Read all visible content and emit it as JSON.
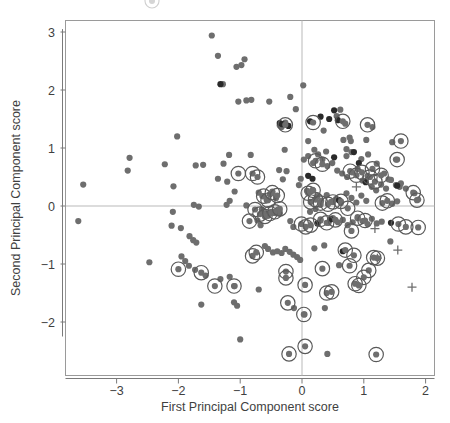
{
  "chart_data": {
    "type": "scatter",
    "title": "",
    "xlabel": "First Principal Component score",
    "ylabel": "Second Principal Component score",
    "xlim": [
      -3.75,
      2.15
    ],
    "ylim": [
      -2.75,
      3.3
    ],
    "xticks": [
      -3,
      -2,
      -1,
      0,
      1,
      2
    ],
    "xticklabels": [
      "−3",
      "−2",
      "−1",
      "0",
      "1",
      "2"
    ],
    "yticks": [
      -2,
      -1,
      0,
      1,
      2,
      3
    ],
    "yticklabels": [
      "−2",
      "−1",
      "0",
      "1",
      "2",
      "3"
    ],
    "grid": false,
    "reference_lines": {
      "vertical_x": 0,
      "horizontal_y": 0,
      "color": "#b9b9b9"
    },
    "legend": {
      "position": "top",
      "visible_fragment": "partially cropped circled-point marker above plot frame"
    },
    "marker_styles": {
      "plain": {
        "name": "plain-point",
        "fill": "#6e6e6e",
        "radius": 3.1
      },
      "dark": {
        "name": "dark-point",
        "fill": "#2a2a2a",
        "radius": 3.1
      },
      "circled": {
        "name": "circled-point",
        "fill": "#6e6e6e",
        "radius": 3.1,
        "ring_radius": 7.2,
        "ring_color": "#5a5a5a"
      },
      "cross": {
        "name": "cross-point",
        "color": "#6e6e6e",
        "size": 4.5
      }
    },
    "series": [
      {
        "name": "plain",
        "style": "plain",
        "points": [
          [
            -1.46,
            2.94
          ],
          [
            -1.36,
            2.59
          ],
          [
            -1.06,
            2.4
          ],
          [
            -0.98,
            2.43
          ],
          [
            -0.93,
            2.53
          ],
          [
            -1.28,
            2.1
          ],
          [
            0.02,
            2.08
          ],
          [
            -1.03,
            1.8
          ],
          [
            -0.9,
            1.82
          ],
          [
            -0.82,
            1.83
          ],
          [
            -0.53,
            1.8
          ],
          [
            -0.19,
            1.88
          ],
          [
            -0.1,
            1.67
          ],
          [
            0.62,
            1.66
          ],
          [
            0.56,
            1.55
          ],
          [
            -2.02,
            1.2
          ],
          [
            -0.27,
            1.44
          ],
          [
            -0.36,
            1.39
          ],
          [
            -0.33,
            1.36
          ],
          [
            0.7,
            1.42
          ],
          [
            0.35,
            1.3
          ],
          [
            0.79,
            1.12
          ],
          [
            0.77,
            1.18
          ],
          [
            1.14,
            1.36
          ],
          [
            0.1,
            1.12
          ],
          [
            -2.79,
            0.83
          ],
          [
            -2.82,
            0.61
          ],
          [
            -3.54,
            0.37
          ],
          [
            -2.22,
            0.72
          ],
          [
            -1.18,
            0.88
          ],
          [
            -0.83,
            0.88
          ],
          [
            -0.28,
            0.97
          ],
          [
            -1.72,
            0.7
          ],
          [
            -1.6,
            0.71
          ],
          [
            -1.27,
            0.73
          ],
          [
            -0.37,
            0.62
          ],
          [
            -0.25,
            0.6
          ],
          [
            -0.31,
            0.46
          ],
          [
            -1.36,
            0.47
          ],
          [
            -2.08,
            0.34
          ],
          [
            -1.21,
            0.42
          ],
          [
            -1.09,
            0.25
          ],
          [
            -1.17,
            0.09
          ],
          [
            -1.22,
            0.02
          ],
          [
            -1.75,
            0.02
          ],
          [
            -1.67,
            -0.01
          ],
          [
            -0.9,
            0.01
          ],
          [
            -0.7,
            0.23
          ],
          [
            -0.64,
            0.17
          ],
          [
            -0.52,
            0.2
          ],
          [
            -0.48,
            0.25
          ],
          [
            -0.42,
            0.14
          ],
          [
            -0.57,
            0.1
          ],
          [
            -0.65,
            -0.06
          ],
          [
            -0.6,
            -0.13
          ],
          [
            -0.55,
            -0.17
          ],
          [
            -0.5,
            -0.1
          ],
          [
            -0.45,
            -0.12
          ],
          [
            -0.39,
            -0.06
          ],
          [
            -0.36,
            -0.13
          ],
          [
            -0.72,
            -0.25
          ],
          [
            -0.67,
            -0.33
          ],
          [
            0.08,
            0.26
          ],
          [
            0.17,
            0.28
          ],
          [
            0.25,
            0.17
          ],
          [
            0.31,
            0.09
          ],
          [
            0.4,
            0.19
          ],
          [
            0.47,
            0.07
          ],
          [
            0.55,
            0.12
          ],
          [
            0.63,
            0.05
          ],
          [
            0.72,
            0.22
          ],
          [
            0.8,
            0.14
          ],
          [
            0.88,
            0.06
          ],
          [
            0.96,
            0.18
          ],
          [
            1.04,
            0.09
          ],
          [
            1.13,
            0.33
          ],
          [
            1.2,
            0.27
          ],
          [
            1.28,
            0.37
          ],
          [
            1.36,
            0.3
          ],
          [
            1.44,
            0.45
          ],
          [
            1.52,
            0.36
          ],
          [
            1.6,
            0.39
          ],
          [
            1.68,
            0.3
          ],
          [
            0.03,
            0.8
          ],
          [
            0.1,
            0.86
          ],
          [
            0.18,
            0.74
          ],
          [
            0.26,
            0.89
          ],
          [
            0.33,
            0.8
          ],
          [
            0.41,
            0.69
          ],
          [
            0.49,
            0.74
          ],
          [
            0.57,
            0.61
          ],
          [
            0.65,
            0.56
          ],
          [
            0.73,
            0.5
          ],
          [
            0.81,
            0.58
          ],
          [
            0.9,
            0.64
          ],
          [
            0.98,
            0.44
          ],
          [
            1.06,
            0.52
          ],
          [
            0.72,
            0.86
          ],
          [
            0.8,
            0.93
          ],
          [
            0.96,
            0.81
          ],
          [
            1.07,
            0.89
          ],
          [
            1.21,
            0.73
          ],
          [
            1.46,
            1.1
          ],
          [
            1.52,
            0.8
          ],
          [
            1.33,
            0.56
          ],
          [
            1.4,
            0.46
          ],
          [
            -3.62,
            -0.26
          ],
          [
            -2.47,
            -0.97
          ],
          [
            -2.09,
            -0.1
          ],
          [
            -2.11,
            -0.34
          ],
          [
            -1.96,
            -0.38
          ],
          [
            -1.82,
            -0.52
          ],
          [
            -1.76,
            -0.59
          ],
          [
            -1.71,
            -0.63
          ],
          [
            -1.95,
            -0.87
          ],
          [
            -1.89,
            -0.95
          ],
          [
            -1.83,
            -1.03
          ],
          [
            -1.73,
            -1.1
          ],
          [
            -1.56,
            -1.2
          ],
          [
            -1.63,
            -1.7
          ],
          [
            -1.32,
            -1.26
          ],
          [
            -1.17,
            -1.22
          ],
          [
            -1.09,
            -1.38
          ],
          [
            -1.1,
            -1.66
          ],
          [
            -1.05,
            -1.72
          ],
          [
            -1.0,
            -2.3
          ],
          [
            -0.7,
            -1.44
          ],
          [
            -0.6,
            -0.69
          ],
          [
            -0.55,
            -0.74
          ],
          [
            -0.47,
            -0.8
          ],
          [
            -0.4,
            -0.78
          ],
          [
            -0.33,
            -0.81
          ],
          [
            -0.27,
            -0.74
          ],
          [
            -0.2,
            -0.79
          ],
          [
            -0.14,
            -0.84
          ],
          [
            -0.08,
            -0.88
          ],
          [
            -0.03,
            -0.93
          ],
          [
            0.04,
            -1.87
          ],
          [
            -0.13,
            -1.76
          ],
          [
            0.37,
            -1.76
          ],
          [
            0.41,
            -2.55
          ],
          [
            -0.14,
            -0.36
          ],
          [
            -0.19,
            -0.26
          ],
          [
            0.2,
            -0.73
          ],
          [
            0.36,
            -0.68
          ],
          [
            0.3,
            -0.25
          ],
          [
            0.43,
            -0.29
          ],
          [
            0.5,
            -0.21
          ],
          [
            0.58,
            -0.28
          ],
          [
            0.66,
            -0.24
          ],
          [
            0.74,
            -0.33
          ],
          [
            0.82,
            -0.28
          ],
          [
            0.9,
            -0.19
          ],
          [
            0.98,
            -0.26
          ],
          [
            1.06,
            -0.31
          ],
          [
            0.6,
            -1.02
          ],
          [
            1.13,
            -0.22
          ],
          [
            1.21,
            -0.3
          ],
          [
            1.29,
            -0.27
          ],
          [
            1.43,
            -0.61
          ],
          [
            0.13,
            -0.1
          ],
          [
            0.22,
            -0.05
          ],
          [
            0.3,
            0.02
          ],
          [
            1.46,
            0.04
          ],
          [
            1.54,
            0.08
          ],
          [
            1.82,
            0.22
          ],
          [
            1.88,
            0.11
          ],
          [
            1.58,
            0.33
          ],
          [
            0.67,
            1.14
          ],
          [
            1.04,
            1.14
          ],
          [
            0.72,
            0.98
          ],
          [
            0.39,
            0.94
          ],
          [
            0.2,
            0.97
          ],
          [
            -0.02,
            0.47
          ],
          [
            -0.05,
            0.36
          ]
        ]
      },
      {
        "name": "dark",
        "style": "dark",
        "points": [
          [
            -1.32,
            2.1
          ],
          [
            0.52,
            1.65
          ],
          [
            0.3,
            1.54
          ],
          [
            0.44,
            1.5
          ],
          [
            -0.32,
            1.41
          ],
          [
            -0.36,
            1.43
          ],
          [
            -0.22,
            1.38
          ],
          [
            0.13,
            1.46
          ],
          [
            0.58,
            1.48
          ],
          [
            0.84,
            0.93
          ],
          [
            0.1,
            0.52
          ],
          [
            0.17,
            0.47
          ],
          [
            0.52,
            0.84
          ],
          [
            0.47,
            -0.23
          ],
          [
            0.6,
            0.1
          ],
          [
            1.03,
            0.41
          ],
          [
            1.54,
            0.35
          ],
          [
            1.44,
            -0.29
          ],
          [
            0.66,
            -0.78
          ],
          [
            0.25,
            -0.3
          ],
          [
            0.92,
            0.74
          ]
        ]
      },
      {
        "name": "circled",
        "style": "circled",
        "points": [
          [
            -0.27,
            1.4
          ],
          [
            0.18,
            1.44
          ],
          [
            0.66,
            1.46
          ],
          [
            1.06,
            1.4
          ],
          [
            1.6,
            1.12
          ],
          [
            1.54,
            0.8
          ],
          [
            1.14,
            0.64
          ],
          [
            -0.8,
            0.56
          ],
          [
            -0.72,
            0.5
          ],
          [
            -1.03,
            0.56
          ],
          [
            -0.62,
            0.17
          ],
          [
            -0.55,
            0.1
          ],
          [
            -0.48,
            0.23
          ],
          [
            -0.4,
            0.18
          ],
          [
            -0.76,
            -0.06
          ],
          [
            -0.68,
            -0.14
          ],
          [
            -0.6,
            -0.18
          ],
          [
            -0.52,
            -0.13
          ],
          [
            -0.44,
            -0.1
          ],
          [
            -0.36,
            -0.05
          ],
          [
            -0.85,
            -0.26
          ],
          [
            0.14,
            0.07
          ],
          [
            0.22,
            0.11
          ],
          [
            0.3,
            0.05
          ],
          [
            0.42,
            0.03
          ],
          [
            0.5,
            0.07
          ],
          [
            0.1,
            0.22
          ],
          [
            0.18,
            0.27
          ],
          [
            0.63,
            0.08
          ],
          [
            0.74,
            -0.04
          ],
          [
            1.1,
            0.5
          ],
          [
            1.18,
            0.42
          ],
          [
            1.3,
            0.05
          ],
          [
            1.38,
            0.09
          ],
          [
            1.8,
            0.23
          ],
          [
            1.86,
            0.1
          ],
          [
            1.28,
            0.53
          ],
          [
            -0.01,
            -0.31
          ],
          [
            0.06,
            -0.36
          ],
          [
            0.14,
            -0.33
          ],
          [
            0.3,
            -0.23
          ],
          [
            0.4,
            -0.29
          ],
          [
            0.54,
            -0.24
          ],
          [
            0.8,
            -0.43
          ],
          [
            0.9,
            -0.21
          ],
          [
            1.02,
            -0.25
          ],
          [
            1.56,
            -0.31
          ],
          [
            1.68,
            -0.36
          ],
          [
            1.88,
            -0.37
          ],
          [
            -2.0,
            -1.09
          ],
          [
            -1.63,
            -1.15
          ],
          [
            -1.41,
            -1.38
          ],
          [
            -1.1,
            -1.38
          ],
          [
            -0.8,
            -0.86
          ],
          [
            -0.74,
            -0.8
          ],
          [
            -0.26,
            -1.13
          ],
          [
            -0.26,
            -1.24
          ],
          [
            0.05,
            -1.36
          ],
          [
            0.33,
            -1.08
          ],
          [
            0.7,
            -0.76
          ],
          [
            0.84,
            -0.85
          ],
          [
            0.77,
            -1.03
          ],
          [
            1.08,
            -1.11
          ],
          [
            1.22,
            -0.9
          ],
          [
            1.16,
            -0.89
          ],
          [
            1.0,
            -1.23
          ],
          [
            0.86,
            -1.34
          ],
          [
            0.92,
            -1.37
          ],
          [
            0.4,
            -1.5
          ],
          [
            0.48,
            -1.48
          ],
          [
            -0.23,
            -1.67
          ],
          [
            0.03,
            -1.87
          ],
          [
            0.05,
            -2.42
          ],
          [
            -0.21,
            -2.55
          ],
          [
            1.2,
            -2.56
          ],
          [
            0.78,
            0.6
          ],
          [
            0.88,
            0.53
          ],
          [
            0.97,
            0.58
          ],
          [
            0.22,
            0.78
          ],
          [
            0.33,
            0.72
          ]
        ]
      },
      {
        "name": "cross",
        "style": "cross",
        "points": [
          [
            0.88,
            0.33
          ],
          [
            1.18,
            -0.39
          ],
          [
            1.55,
            -0.76
          ],
          [
            1.22,
            -0.9
          ],
          [
            1.78,
            -1.4
          ]
        ]
      }
    ]
  },
  "figure": {
    "background": "#ffffff",
    "frame_color": "#9a9a9a",
    "axis_text_color": "#3f3f3f"
  }
}
